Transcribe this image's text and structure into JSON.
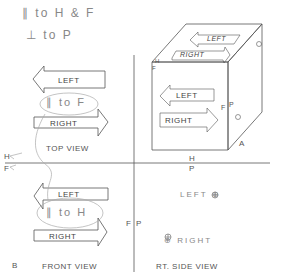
{
  "notes": {
    "line1": "∥ to H & F",
    "line2": "⊥ to P"
  },
  "top_view": {
    "left_label": "LEFT",
    "note": "∥ to F",
    "right_label": "RIGHT",
    "title": "TOP VIEW"
  },
  "front_view": {
    "left_label": "LEFT",
    "note": "∥ to H",
    "right_label": "RIGHT",
    "title": "FRONT VIEW",
    "corner": "B"
  },
  "side_view": {
    "left_label": "LEFT ⊕",
    "right_label": "⊕ RIGHT",
    "title": "RT. SIDE VIEW"
  },
  "fold_lines": {
    "hf_h": "H",
    "hf_f": "F",
    "hp_h": "H",
    "hp_p": "P",
    "fp_f": "F",
    "fp_p": "P"
  },
  "cube": {
    "top_left": "LEFT",
    "top_right": "RIGHT",
    "front_left": "LEFT",
    "front_right": "RIGHT",
    "h": "H",
    "f": "F",
    "side_f": "F",
    "side_p": "P",
    "corner": "A"
  },
  "colors": {
    "line": "#555555",
    "pencil": "#9a9a9a"
  }
}
